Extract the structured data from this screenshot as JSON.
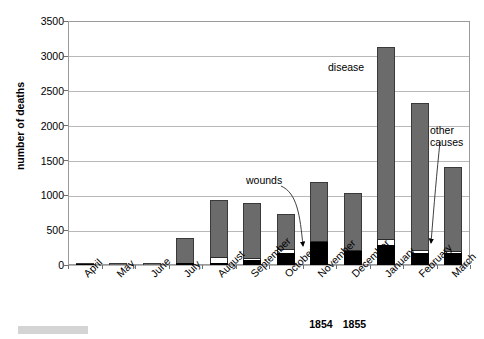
{
  "chart_data": {
    "type": "bar",
    "subtype": "stacked-bar",
    "title": "",
    "xlabel": "",
    "ylabel": "number of deaths",
    "ylim": [
      0,
      3500
    ],
    "ytick_step": 500,
    "yticks": [
      0,
      500,
      1000,
      1500,
      2000,
      2500,
      3000,
      3500
    ],
    "ytick_labels": [
      "0",
      "500",
      "1000",
      "1500",
      "2000",
      "2500",
      "3000",
      "3500"
    ],
    "grid": true,
    "grid_axis": "y",
    "legend": "annotations",
    "categories": [
      "April",
      "May",
      "June",
      "July",
      "August",
      "September",
      "October",
      "November",
      "December",
      "January",
      "February",
      "March"
    ],
    "period_labels": [
      {
        "text": "1854",
        "after_category": "November"
      },
      {
        "text": "1855",
        "after_category": "December"
      }
    ],
    "series": [
      {
        "name": "disease",
        "color": "#6b6b6b",
        "values": [
          5,
          9,
          6,
          359,
          828,
          788,
          503,
          844,
          828,
          2761,
          2120,
          1205
        ]
      },
      {
        "name": "wounds",
        "color": "#ffffff",
        "values": [
          0,
          0,
          0,
          0,
          81,
          32,
          48,
          24,
          7,
          82,
          42,
          32
        ]
      },
      {
        "name": "other causes",
        "color": "#000000",
        "values": [
          12,
          6,
          3,
          27,
          30,
          70,
          178,
          323,
          204,
          287,
          168,
          172
        ]
      }
    ],
    "totals": [
      17,
      15,
      9,
      386,
      939,
      890,
      729,
      1191,
      1039,
      3130,
      2330,
      1409
    ],
    "annotations": [
      {
        "text": "disease",
        "points_to": "disease-segment"
      },
      {
        "text": "wounds",
        "points_to": "wounds-segment-november"
      },
      {
        "text": "other\ncauses",
        "points_to": "other-causes-segment-february"
      }
    ]
  },
  "axis": {
    "y_title": "number of deaths"
  },
  "annotations": {
    "disease": "disease",
    "wounds": "wounds",
    "other_causes": "other\ncauses"
  }
}
